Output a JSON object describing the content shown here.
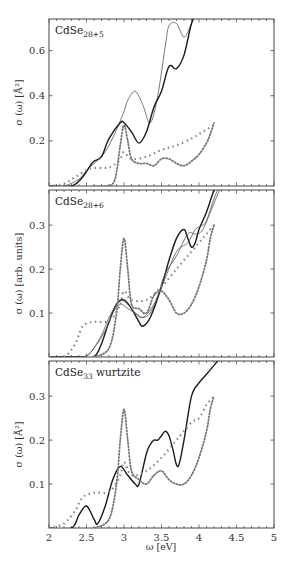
{
  "chart_data": [
    {
      "type": "line",
      "panel_label": "CdSe",
      "panel_subscript": "28+5",
      "ylabel": "σ (ω) [Å²]",
      "xlabel": "",
      "xlim": [
        2,
        5
      ],
      "ylim": [
        0,
        0.74
      ],
      "yticks": [
        0.2,
        0.4,
        0.6
      ],
      "ytick_labels": [
        "0.2",
        "0.4",
        "0.6"
      ],
      "grid": false,
      "series": [
        {
          "name": "thin solid",
          "style": "thin",
          "x": [
            2.0,
            2.2,
            2.4,
            2.5,
            2.6,
            2.7,
            2.8,
            2.9,
            3.0,
            3.05,
            3.15,
            3.25,
            3.35,
            3.45,
            3.55,
            3.6,
            3.7,
            3.8,
            3.9,
            4.0
          ],
          "y": [
            0,
            0.0,
            0.03,
            0.07,
            0.1,
            0.13,
            0.18,
            0.25,
            0.33,
            0.38,
            0.42,
            0.36,
            0.28,
            0.4,
            0.62,
            0.71,
            0.72,
            0.66,
            0.72,
            0.8
          ]
        },
        {
          "name": "thick solid",
          "style": "thick",
          "x": [
            2.0,
            2.3,
            2.45,
            2.55,
            2.6,
            2.7,
            2.8,
            2.95,
            3.0,
            3.1,
            3.2,
            3.3,
            3.4,
            3.5,
            3.6,
            3.7,
            3.8,
            3.9,
            4.0
          ],
          "y": [
            0,
            0.0,
            0.04,
            0.09,
            0.11,
            0.13,
            0.21,
            0.28,
            0.28,
            0.24,
            0.19,
            0.24,
            0.35,
            0.42,
            0.53,
            0.52,
            0.58,
            0.72,
            0.8
          ]
        },
        {
          "name": "dotted peak",
          "style": "dots",
          "x": [
            2.6,
            2.75,
            2.85,
            2.9,
            2.95,
            3.0,
            3.05,
            3.1,
            3.2,
            3.3,
            3.4,
            3.5,
            3.6,
            3.7,
            3.8,
            3.9,
            4.0,
            4.1,
            4.15,
            4.2
          ],
          "y": [
            0,
            0.0,
            0.01,
            0.06,
            0.18,
            0.27,
            0.2,
            0.12,
            0.1,
            0.1,
            0.09,
            0.12,
            0.12,
            0.1,
            0.09,
            0.11,
            0.14,
            0.19,
            0.23,
            0.28
          ]
        },
        {
          "name": "crosses",
          "style": "crosses",
          "x": [
            2.0,
            2.2,
            2.35,
            2.5,
            2.6,
            2.75,
            2.85,
            2.95,
            3.0,
            3.1,
            3.3,
            3.5,
            3.7,
            3.9,
            4.0,
            4.1,
            4.2
          ],
          "y": [
            0,
            0.01,
            0.04,
            0.07,
            0.08,
            0.08,
            0.09,
            0.12,
            0.15,
            0.12,
            0.13,
            0.16,
            0.18,
            0.21,
            0.23,
            0.25,
            0.27
          ]
        }
      ]
    },
    {
      "type": "line",
      "panel_label": "CdSe",
      "panel_subscript": "28+6",
      "ylabel": "σ (ω) [arb. units]",
      "xlabel": "",
      "xlim": [
        2,
        5
      ],
      "ylim": [
        0,
        0.38
      ],
      "yticks": [
        0.1,
        0.2,
        0.3
      ],
      "ytick_labels": [
        "0.1",
        "0.2",
        "0.3"
      ],
      "grid": false,
      "series": [
        {
          "name": "thick solid",
          "style": "thick",
          "x": [
            2.0,
            2.4,
            2.6,
            2.7,
            2.8,
            2.9,
            3.0,
            3.1,
            3.2,
            3.25,
            3.35,
            3.5,
            3.6,
            3.7,
            3.8,
            3.85,
            3.9,
            3.95,
            4.0,
            4.1,
            4.2,
            4.3
          ],
          "y": [
            0,
            0.0,
            0.0,
            0.03,
            0.08,
            0.12,
            0.13,
            0.11,
            0.08,
            0.07,
            0.09,
            0.16,
            0.22,
            0.27,
            0.29,
            0.27,
            0.25,
            0.26,
            0.29,
            0.33,
            0.38,
            0.42
          ]
        },
        {
          "name": "thin solid a",
          "style": "thin",
          "x": [
            2.0,
            2.4,
            2.55,
            2.7,
            2.8,
            2.9,
            2.95,
            3.05,
            3.15,
            3.25,
            3.4,
            3.55,
            3.7,
            3.85,
            3.95,
            4.05,
            4.1,
            4.2,
            4.3
          ],
          "y": [
            0,
            0.0,
            0.01,
            0.05,
            0.09,
            0.12,
            0.13,
            0.12,
            0.1,
            0.09,
            0.12,
            0.18,
            0.24,
            0.26,
            0.29,
            0.3,
            0.31,
            0.36,
            0.4
          ]
        },
        {
          "name": "thin solid b",
          "style": "thin",
          "x": [
            2.0,
            2.45,
            2.6,
            2.75,
            2.85,
            2.95,
            3.05,
            3.15,
            3.25,
            3.35,
            3.45,
            3.55,
            3.7,
            3.85,
            3.95,
            4.05,
            4.2,
            4.3
          ],
          "y": [
            0,
            0.0,
            0.02,
            0.06,
            0.1,
            0.12,
            0.11,
            0.1,
            0.09,
            0.1,
            0.14,
            0.19,
            0.23,
            0.28,
            0.28,
            0.29,
            0.35,
            0.39
          ]
        },
        {
          "name": "dotted peak",
          "style": "dots",
          "x": [
            2.6,
            2.8,
            2.9,
            2.95,
            3.0,
            3.05,
            3.1,
            3.2,
            3.3,
            3.4,
            3.5,
            3.6,
            3.7,
            3.8,
            3.9,
            4.0,
            4.1,
            4.15,
            4.2
          ],
          "y": [
            0,
            0.02,
            0.1,
            0.2,
            0.27,
            0.2,
            0.12,
            0.11,
            0.1,
            0.14,
            0.15,
            0.13,
            0.1,
            0.1,
            0.12,
            0.16,
            0.22,
            0.27,
            0.3
          ]
        },
        {
          "name": "crosses",
          "style": "crosses",
          "x": [
            2.0,
            2.2,
            2.35,
            2.45,
            2.6,
            2.75,
            2.85,
            2.95,
            3.0,
            3.1,
            3.3,
            3.5,
            3.7,
            3.9,
            4.0,
            4.1,
            4.2
          ],
          "y": [
            0,
            0.0,
            0.03,
            0.07,
            0.08,
            0.08,
            0.09,
            0.12,
            0.15,
            0.13,
            0.13,
            0.16,
            0.2,
            0.24,
            0.26,
            0.28,
            0.3
          ]
        }
      ]
    },
    {
      "type": "line",
      "panel_label": "CdSe",
      "panel_subscript": "33",
      "panel_suffix": " wurtzite",
      "ylabel": "σ (ω) [Å²]",
      "xlabel": "ω [eV]",
      "xlim": [
        2,
        5
      ],
      "ylim": [
        0,
        0.38
      ],
      "xticks": [
        2,
        2.5,
        3,
        3.5,
        4,
        4.5,
        5
      ],
      "xtick_labels": [
        "2",
        "2.5",
        "3",
        "3.5",
        "4",
        "4.5",
        "5"
      ],
      "yticks": [
        0.1,
        0.2,
        0.3
      ],
      "ytick_labels": [
        "0.1",
        "0.2",
        "0.3"
      ],
      "grid": false,
      "series": [
        {
          "name": "solid",
          "style": "thick",
          "x": [
            2.0,
            2.3,
            2.4,
            2.5,
            2.6,
            2.65,
            2.75,
            2.85,
            2.95,
            3.05,
            3.15,
            3.2,
            3.3,
            3.35,
            3.4,
            3.45,
            3.5,
            3.55,
            3.6,
            3.65,
            3.72,
            3.8,
            3.9,
            4.0,
            4.1,
            4.2,
            4.25
          ],
          "y": [
            0,
            0.0,
            0.03,
            0.05,
            0.02,
            0.01,
            0.05,
            0.11,
            0.14,
            0.12,
            0.1,
            0.1,
            0.17,
            0.19,
            0.2,
            0.2,
            0.21,
            0.22,
            0.21,
            0.18,
            0.14,
            0.2,
            0.3,
            0.33,
            0.35,
            0.37,
            0.38
          ]
        },
        {
          "name": "dotted peak",
          "style": "dots",
          "x": [
            2.6,
            2.8,
            2.9,
            2.95,
            3.0,
            3.05,
            3.1,
            3.2,
            3.3,
            3.4,
            3.5,
            3.6,
            3.7,
            3.8,
            3.9,
            4.0,
            4.1,
            4.15,
            4.2
          ],
          "y": [
            0,
            0.02,
            0.1,
            0.2,
            0.27,
            0.2,
            0.13,
            0.11,
            0.1,
            0.12,
            0.13,
            0.11,
            0.1,
            0.1,
            0.12,
            0.16,
            0.22,
            0.27,
            0.3
          ]
        },
        {
          "name": "crosses",
          "style": "crosses",
          "x": [
            2.0,
            2.2,
            2.35,
            2.45,
            2.6,
            2.75,
            2.85,
            2.95,
            3.0,
            3.1,
            3.3,
            3.5,
            3.7,
            3.9,
            4.0,
            4.1,
            4.2
          ],
          "y": [
            0,
            0.01,
            0.04,
            0.07,
            0.08,
            0.08,
            0.09,
            0.12,
            0.15,
            0.12,
            0.13,
            0.16,
            0.2,
            0.24,
            0.25,
            0.28,
            0.3
          ]
        }
      ]
    }
  ],
  "layout": {
    "panels": [
      {
        "top": 19,
        "bottom": 186
      },
      {
        "top": 190,
        "bottom": 357
      },
      {
        "top": 361,
        "bottom": 528
      }
    ],
    "left": 49,
    "right": 274
  }
}
